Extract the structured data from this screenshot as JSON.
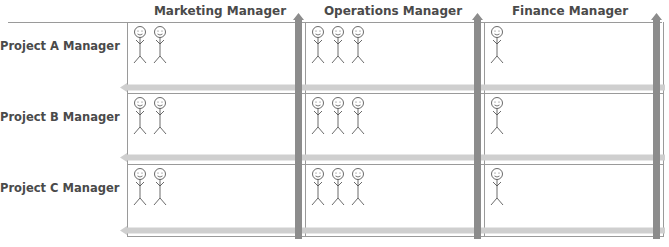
{
  "columns": [
    {
      "label": "Marketing Manager"
    },
    {
      "label": "Operations Manager"
    },
    {
      "label": "Finance Manager"
    }
  ],
  "rows": [
    {
      "label": "Project A Manager",
      "staff": [
        2,
        3,
        1
      ]
    },
    {
      "label": "Project B Manager",
      "staff": [
        2,
        3,
        1
      ]
    },
    {
      "label": "Project C Manager",
      "staff": [
        2,
        3,
        1
      ]
    }
  ],
  "colors": {
    "vertical_arrow": "#8c8c8c",
    "horizontal_arrow": "#cfcfcf",
    "grid_line": "#9a9a9a",
    "text": "#4a4a4a"
  }
}
